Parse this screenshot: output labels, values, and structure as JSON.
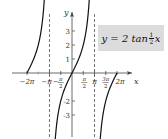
{
  "chart_data": {
    "type": "line",
    "function": "y = 2*tan(x/2)",
    "xlabel": "x",
    "ylabel": "y",
    "x_tick_labels": [
      "-2π",
      "-π",
      "-π/2",
      "π/2",
      "π",
      "3π/2",
      "2π"
    ],
    "x_ticks": [
      -6.2832,
      -3.1416,
      -1.5708,
      1.5708,
      3.1416,
      4.7124,
      6.2832
    ],
    "y_tick_labels": [
      "3",
      "2",
      "1",
      "-2",
      "-3"
    ],
    "y_ticks": [
      3,
      2,
      1,
      -2,
      -3
    ],
    "asymptotes": [
      -3.1416,
      3.1416
    ],
    "asymptote_style": "dashed",
    "xlim": [
      -7.5,
      8.5
    ],
    "ylim": [
      -4.3,
      4.8
    ],
    "grid": false,
    "legend": null,
    "annotation": {
      "text": "y = 2 tan ½x",
      "position": "upper-right",
      "background": "#dcdcdc"
    },
    "branches": [
      {
        "x_range": [
          -6.2832,
          -3.55
        ],
        "points": [
          [
            -6.2832,
            0
          ],
          [
            -5.5,
            0.8
          ],
          [
            -4.71,
            2
          ],
          [
            -4.2,
            3
          ],
          [
            -3.8,
            4.4
          ]
        ]
      },
      {
        "x_range": [
          -2.7,
          2.7
        ],
        "points": [
          [
            -2.7,
            -4.3
          ],
          [
            -2.2,
            -2.5
          ],
          [
            -1.5708,
            -2
          ],
          [
            -1,
            -1.09
          ],
          [
            0,
            0
          ],
          [
            1,
            1.09
          ],
          [
            1.5708,
            2
          ],
          [
            2.2,
            2.5
          ],
          [
            2.75,
            4.6
          ]
        ]
      },
      {
        "x_range": [
          3.6,
          6.2832
        ],
        "points": [
          [
            3.6,
            -4.3
          ],
          [
            4.0,
            -3.2
          ],
          [
            4.71,
            -2
          ],
          [
            5.5,
            -0.8
          ],
          [
            6.2832,
            0
          ]
        ]
      }
    ]
  },
  "labels": {
    "x_axis": "x",
    "y_axis": "y",
    "eq_prefix": "y = 2 tan ",
    "eq_num": "1",
    "eq_den": "2",
    "eq_var": "x"
  }
}
